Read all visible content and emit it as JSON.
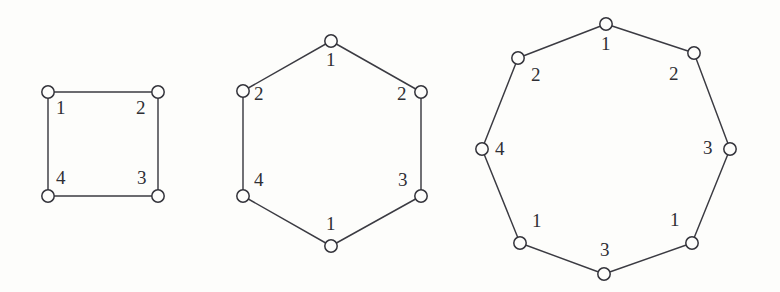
{
  "figure": {
    "background_color": "#fdfdfb",
    "stroke_color": "#3b3b42",
    "node_fill_color": "#fdfdfb",
    "node_stroke_color": "#33333a",
    "label_color": "#2e2e34",
    "width": 780,
    "height": 292
  },
  "diagrams": [
    {
      "name": "square-4-cycle",
      "shape": "square",
      "vertex_count": 4,
      "center": {
        "x": 103,
        "y": 144
      },
      "vertices": [
        {
          "id": "sq-v1",
          "label": "1",
          "x": 48,
          "y": 92,
          "label_x": 56,
          "label_y": 98
        },
        {
          "id": "sq-v2",
          "label": "2",
          "x": 158,
          "y": 92,
          "label_x": 136,
          "label_y": 98
        },
        {
          "id": "sq-v3",
          "label": "3",
          "x": 158,
          "y": 196,
          "label_x": 137,
          "label_y": 168
        },
        {
          "id": "sq-v4",
          "label": "4",
          "x": 48,
          "y": 196,
          "label_x": 56,
          "label_y": 168
        }
      ],
      "edges": [
        {
          "from": "sq-v1",
          "to": "sq-v2"
        },
        {
          "from": "sq-v2",
          "to": "sq-v3"
        },
        {
          "from": "sq-v3",
          "to": "sq-v4"
        },
        {
          "from": "sq-v4",
          "to": "sq-v1"
        }
      ],
      "label_sequence": [
        "1",
        "2",
        "3",
        "4"
      ]
    },
    {
      "name": "hexagon-6-cycle",
      "shape": "hexagon",
      "vertex_count": 6,
      "center": {
        "x": 331,
        "y": 143
      },
      "vertices": [
        {
          "id": "hx-v1",
          "label": "1",
          "x": 331,
          "y": 41,
          "label_x": 326,
          "label_y": 50
        },
        {
          "id": "hx-v2",
          "label": "2",
          "x": 421,
          "y": 92,
          "label_x": 397,
          "label_y": 84
        },
        {
          "id": "hx-v3",
          "label": "3",
          "x": 421,
          "y": 196,
          "label_x": 398,
          "label_y": 170
        },
        {
          "id": "hx-v4",
          "label": "1",
          "x": 331,
          "y": 246,
          "label_x": 326,
          "label_y": 214
        },
        {
          "id": "hx-v5",
          "label": "4",
          "x": 243,
          "y": 196,
          "label_x": 254,
          "label_y": 170
        },
        {
          "id": "hx-v6",
          "label": "2",
          "x": 243,
          "y": 91,
          "label_x": 254,
          "label_y": 84
        }
      ],
      "edges": [
        {
          "from": "hx-v1",
          "to": "hx-v2"
        },
        {
          "from": "hx-v2",
          "to": "hx-v3"
        },
        {
          "from": "hx-v3",
          "to": "hx-v4"
        },
        {
          "from": "hx-v4",
          "to": "hx-v5"
        },
        {
          "from": "hx-v5",
          "to": "hx-v6"
        },
        {
          "from": "hx-v6",
          "to": "hx-v1"
        }
      ],
      "label_sequence": [
        "1",
        "2",
        "3",
        "1",
        "4",
        "2"
      ]
    },
    {
      "name": "octagon-8-cycle",
      "shape": "octagon",
      "vertex_count": 8,
      "center": {
        "x": 606,
        "y": 149
      },
      "vertices": [
        {
          "id": "oc-v1",
          "label": "1",
          "x": 606,
          "y": 24,
          "label_x": 601,
          "label_y": 34
        },
        {
          "id": "oc-v2",
          "label": "2",
          "x": 694,
          "y": 53,
          "label_x": 669,
          "label_y": 64
        },
        {
          "id": "oc-v3",
          "label": "3",
          "x": 730,
          "y": 149,
          "label_x": 703,
          "label_y": 138
        },
        {
          "id": "oc-v4",
          "label": "1",
          "x": 692,
          "y": 243,
          "label_x": 670,
          "label_y": 210
        },
        {
          "id": "oc-v5",
          "label": "3",
          "x": 604,
          "y": 274,
          "label_x": 600,
          "label_y": 240
        },
        {
          "id": "oc-v6",
          "label": "1",
          "x": 520,
          "y": 243,
          "label_x": 532,
          "label_y": 211
        },
        {
          "id": "oc-v7",
          "label": "4",
          "x": 482,
          "y": 149,
          "label_x": 495,
          "label_y": 139
        },
        {
          "id": "oc-v8",
          "label": "2",
          "x": 518,
          "y": 58,
          "label_x": 531,
          "label_y": 65
        }
      ],
      "edges": [
        {
          "from": "oc-v1",
          "to": "oc-v2"
        },
        {
          "from": "oc-v2",
          "to": "oc-v3"
        },
        {
          "from": "oc-v3",
          "to": "oc-v4"
        },
        {
          "from": "oc-v4",
          "to": "oc-v5"
        },
        {
          "from": "oc-v5",
          "to": "oc-v6"
        },
        {
          "from": "oc-v6",
          "to": "oc-v7"
        },
        {
          "from": "oc-v7",
          "to": "oc-v8"
        },
        {
          "from": "oc-v8",
          "to": "oc-v1"
        }
      ],
      "label_sequence": [
        "1",
        "2",
        "3",
        "1",
        "3",
        "1",
        "4",
        "2"
      ]
    }
  ]
}
